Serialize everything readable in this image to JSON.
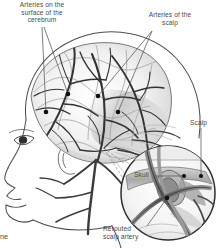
{
  "figure": {
    "kind": "medical-illustration",
    "style": "grayscale pen-and-ink anatomical drawing",
    "palette": {
      "background": "#ffffff",
      "ink": "#3a3a3a",
      "label_text": "#4a4a4a",
      "leader_line": "#555555",
      "marker_dot": "#111111",
      "shading_light": "#e2e2e2",
      "shading_mid": "#bdbdbd",
      "shading_dark": "#8a8a8a"
    }
  },
  "labels": {
    "cerebrum_arteries": {
      "text": "Arteries on the\nsurface of the\ncerebrum",
      "lines": [
        "Arteries on the",
        "surface of the",
        "cerebrum"
      ]
    },
    "scalp_arteries": {
      "text": "Arteries of the\nscalp",
      "lines": [
        "Arteries of the",
        "scalp"
      ]
    },
    "scalp": {
      "text": "Scalp"
    },
    "skull": {
      "text": "Skull"
    },
    "rerouted_scalp_artery": {
      "text": "Rerouted\nscalp artery",
      "lines": [
        "Rerouted",
        "scalp artery"
      ]
    },
    "cropped_caption_fragment": {
      "text": "ne"
    }
  }
}
